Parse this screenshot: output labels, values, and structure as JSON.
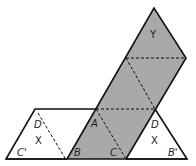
{
  "diagram": {
    "colors": {
      "shaded": "#a9a9a9",
      "stroke": "#111111",
      "background": "#ffffff"
    },
    "labels": {
      "Y": "Y",
      "A": "A",
      "B": "B",
      "C": "C",
      "D_left": "D",
      "D_right": "D",
      "X_left": "X",
      "X_right": "X",
      "C_prime": "C'",
      "B_prime": "B'"
    }
  }
}
